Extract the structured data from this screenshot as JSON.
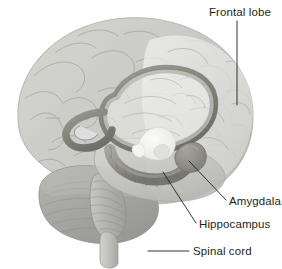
{
  "figure": {
    "background_color": "#ffffff",
    "width": 282,
    "height": 269
  },
  "labels": [
    {
      "id": "frontal-lobe",
      "text": "Frontal lobe",
      "text_x": 209,
      "text_y": 16,
      "anchor": "start",
      "leader": "M237,21 L237,105"
    },
    {
      "id": "amygdala",
      "text": "Amygdala",
      "text_x": 229,
      "text_y": 205,
      "anchor": "start",
      "leader": "M189,161 L226,200"
    },
    {
      "id": "hippocampus",
      "text": "Hippocampus",
      "text_x": 199,
      "text_y": 228,
      "anchor": "start",
      "leader": "M163,172 L196,223"
    },
    {
      "id": "spinal-cord",
      "text": "Spinal cord",
      "text_x": 193,
      "text_y": 255,
      "anchor": "start",
      "leader": "M148,251 L189,251"
    }
  ],
  "colors": {
    "text": "#231f20",
    "leader_line": "#231f20",
    "cortex_light": "#e3e3e1",
    "cortex_mid": "#cfcfcc",
    "cortex_shadow": "#b8b8b4",
    "temporal_lobe": "#c4c4c0",
    "cerebellum": "#a8a8a4",
    "brainstem": "#b0b0ac",
    "spinal_cord_shape": "#c2c2be",
    "limbic_ring": "#8e8e8a",
    "limbic_ring_dark": "#76766f",
    "hippocampus_body": "#9a9a94",
    "amygdala_body": "#8c8c86",
    "thalamus": "#f2f2f0",
    "sulci_stroke": "#9a9a96"
  },
  "structures": [
    {
      "id": "cerebral-cortex",
      "name": "Cerebral cortex"
    },
    {
      "id": "frontal-lobe-region",
      "name": "Frontal lobe"
    },
    {
      "id": "temporal-lobe-region",
      "name": "Temporal lobe"
    },
    {
      "id": "cerebellum-region",
      "name": "Cerebellum"
    },
    {
      "id": "brainstem-region",
      "name": "Brainstem"
    },
    {
      "id": "spinal-cord-region",
      "name": "Spinal cord"
    },
    {
      "id": "corpus-callosum-ring",
      "name": "Corpus callosum / fornix ring"
    },
    {
      "id": "hippocampus-region",
      "name": "Hippocampus"
    },
    {
      "id": "amygdala-region",
      "name": "Amygdala"
    },
    {
      "id": "thalamus-region",
      "name": "Thalamus"
    }
  ]
}
